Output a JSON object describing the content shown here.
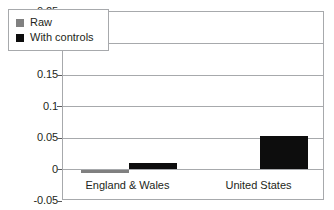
{
  "chart_data": {
    "type": "bar",
    "title": "",
    "subtitle": "",
    "xlabel": "",
    "ylabel": "",
    "categories": [
      "England & Wales",
      "United States"
    ],
    "series": [
      {
        "name": "Raw",
        "color": "#808080",
        "values": [
          -0.006,
          0.0
        ]
      },
      {
        "name": "With controls",
        "color": "#0d0d0d",
        "values": [
          0.011,
          0.053
        ]
      }
    ],
    "ylim": [
      -0.05,
      0.25
    ],
    "yticks": [
      0.25,
      0.2,
      0.15,
      0.1,
      0.05,
      0,
      -0.05
    ],
    "ytick_labels": [
      "0.25",
      "0.2",
      "0.15",
      "0.1",
      "0.05",
      "0",
      "-0.05"
    ],
    "grid": "horizontal",
    "legend_position": "top-left-inside",
    "frame": true
  },
  "legend": {
    "items": [
      {
        "label": "Raw",
        "swatch": "raw"
      },
      {
        "label": "With controls",
        "swatch": "controls"
      }
    ]
  }
}
